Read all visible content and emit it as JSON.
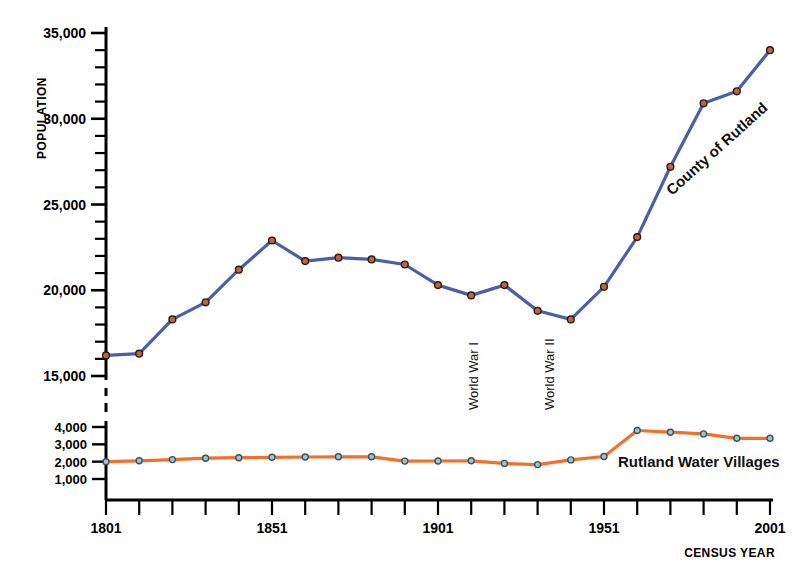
{
  "chart_data": {
    "type": "line",
    "title": "",
    "xlabel": "CENSUS YEAR",
    "ylabel": "POPULATION",
    "x": [
      1801,
      1811,
      1821,
      1831,
      1841,
      1851,
      1861,
      1871,
      1881,
      1891,
      1901,
      1911,
      1921,
      1931,
      1941,
      1951,
      1961,
      1971,
      1981,
      1991,
      2001
    ],
    "xtick_labels": [
      "1801",
      "1851",
      "1901",
      "1951",
      "2001"
    ],
    "xtick_values": [
      1801,
      1851,
      1901,
      1951,
      2001
    ],
    "xlim": [
      1801,
      2001
    ],
    "xminor_step": 10,
    "grid": false,
    "legend_position": "inline-annotation",
    "panels": [
      {
        "name": "upper",
        "ylim": [
          15000,
          35000
        ],
        "ytick_labels": [
          "15,000",
          "20,000",
          "25,000",
          "30,000",
          "35,000"
        ],
        "ytick_values": [
          15000,
          20000,
          25000,
          30000,
          35000
        ],
        "yminor_step": 1000,
        "axis_break_below": true
      },
      {
        "name": "lower",
        "ylim": [
          500,
          4500
        ],
        "ytick_labels": [
          "1,000",
          "2,000",
          "3,000",
          "4,000"
        ],
        "ytick_values": [
          1000,
          2000,
          3000,
          4000
        ],
        "yminor_step": 1000,
        "axis_break_above": true
      }
    ],
    "series": [
      {
        "name": "County of Rutland",
        "panel": "upper",
        "color": "#4A5FA8",
        "marker_color": "#C1643C",
        "marker_edge": "#2B1B10",
        "label_rotation_deg": -42,
        "values": [
          16200,
          16300,
          18300,
          19300,
          21200,
          22900,
          21700,
          21900,
          21800,
          21500,
          20300,
          19700,
          20300,
          18800,
          18300,
          20200,
          23100,
          27200,
          30900,
          31600,
          34000
        ]
      },
      {
        "name": "Rutland Water Villages",
        "panel": "lower",
        "color": "#F2702A",
        "marker_color": "#9FC5D4",
        "marker_edge": "#3A5360",
        "label_rotation_deg": 0,
        "values": [
          2000,
          2050,
          2120,
          2200,
          2230,
          2250,
          2270,
          2280,
          2280,
          2030,
          2040,
          2050,
          1900,
          1830,
          2100,
          2300,
          3800,
          3700,
          3600,
          3350,
          3350
        ]
      }
    ],
    "annotations": [
      {
        "text": "World War I",
        "x": 1913,
        "rotation_deg": -90
      },
      {
        "text": "World War II",
        "x": 1936,
        "rotation_deg": -90
      }
    ]
  },
  "axis": {
    "y_title": "POPULATION",
    "x_title": "CENSUS YEAR"
  }
}
